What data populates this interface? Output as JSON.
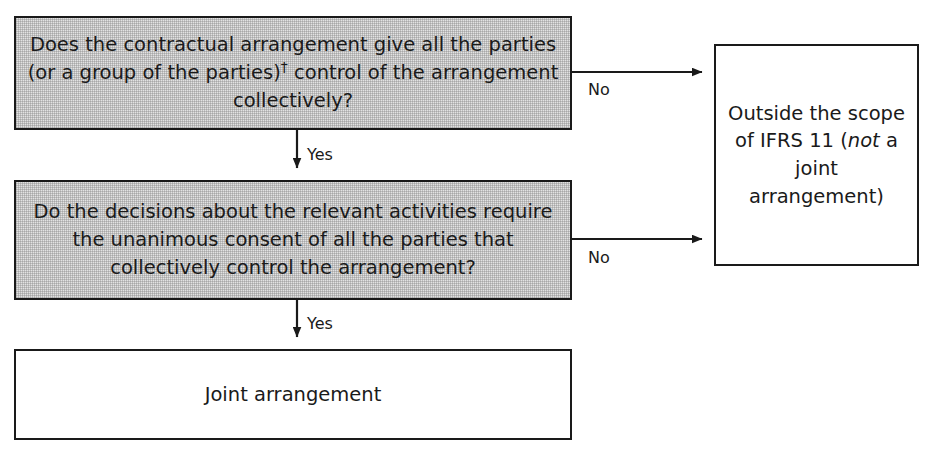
{
  "diagram": {
    "colors": {
      "decision_fill": "#e2e2e2",
      "terminal_fill": "#ffffff",
      "stroke": "#1a1a1a",
      "background": "#ffffff"
    },
    "nodes": {
      "q1": {
        "id": "q1",
        "kind": "decision",
        "text_part1": "Does the contractual arrangement give all the parties (or a group of the parties)",
        "dagger": "†",
        "text_part2": " control of the arrangement collectively?"
      },
      "q2": {
        "id": "q2",
        "kind": "decision",
        "text": "Do the decisions about the relevant activities require the unanimous consent of all the parties that collectively control the arrangement?"
      },
      "outside": {
        "id": "outside",
        "kind": "terminal",
        "text_part1": "Outside the scope of IFRS 11 (",
        "text_italic": "not",
        "text_part2": " a joint arrangement)"
      },
      "joint": {
        "id": "joint",
        "kind": "terminal",
        "text": "Joint arrangement"
      }
    },
    "edges": [
      {
        "id": "q1-no",
        "from": "q1",
        "to": "outside",
        "label": "No"
      },
      {
        "id": "q1-yes",
        "from": "q1",
        "to": "q2",
        "label": "Yes"
      },
      {
        "id": "q2-no",
        "from": "q2",
        "to": "outside",
        "label": "No"
      },
      {
        "id": "q2-yes",
        "from": "q2",
        "to": "joint",
        "label": "Yes"
      }
    ]
  }
}
